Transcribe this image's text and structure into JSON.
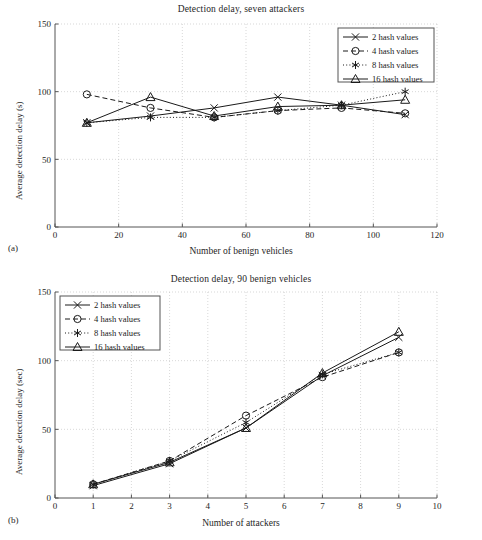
{
  "figure": {
    "panels": [
      {
        "panel_id": "(a)",
        "title": "Detection delay, seven attackers",
        "xlabel": "Number of benign vehicles",
        "ylabel": "Average detection delay (s)",
        "xticks": [
          "0",
          "20",
          "40",
          "60",
          "80",
          "100",
          "120"
        ],
        "yticks": [
          "0",
          "50",
          "100",
          "150"
        ],
        "legend": [
          {
            "label": "2 hash values",
            "marker": "x-cross",
            "dash": "solid"
          },
          {
            "label": "4 hash values",
            "marker": "circle",
            "dash": "dashed"
          },
          {
            "label": "8 hash values",
            "marker": "asterisk",
            "dash": "dotted"
          },
          {
            "label": "16 hash values",
            "marker": "triangle",
            "dash": "solid"
          }
        ]
      },
      {
        "panel_id": "(b)",
        "title": "Detection delay, 90 benign vehicles",
        "xlabel": "Number of attackers",
        "ylabel": "Average detection delay (sec)",
        "xticks": [
          "0",
          "1",
          "2",
          "3",
          "4",
          "5",
          "6",
          "7",
          "8",
          "9",
          "10"
        ],
        "yticks": [
          "0",
          "50",
          "100",
          "150"
        ],
        "legend": [
          {
            "label": "2 hash values",
            "marker": "x-cross",
            "dash": "solid"
          },
          {
            "label": "4 hash values",
            "marker": "circle",
            "dash": "dashed"
          },
          {
            "label": "8 hash values",
            "marker": "asterisk",
            "dash": "dotted"
          },
          {
            "label": "16 hash values",
            "marker": "triangle",
            "dash": "solid"
          }
        ]
      }
    ]
  },
  "chart_data": [
    {
      "type": "line",
      "panel": "(a)",
      "title": "Detection delay, seven attackers",
      "xlabel": "Number of benign vehicles",
      "ylabel": "Average detection delay (s)",
      "xlim": [
        0,
        120
      ],
      "ylim": [
        0,
        150
      ],
      "xticks": [
        0,
        20,
        40,
        60,
        80,
        100,
        120
      ],
      "yticks": [
        0,
        50,
        100,
        150
      ],
      "grid": true,
      "legend_position": "top-right",
      "x": [
        10,
        30,
        50,
        70,
        90,
        110
      ],
      "series": [
        {
          "name": "2 hash values",
          "marker": "x-cross",
          "dash": "solid",
          "values": [
            77,
            82,
            88,
            96,
            90,
            83
          ]
        },
        {
          "name": "4 hash values",
          "marker": "circle",
          "dash": "dashed",
          "values": [
            98,
            88,
            81,
            86,
            88,
            84
          ]
        },
        {
          "name": "8 hash values",
          "marker": "asterisk",
          "dash": "dotted",
          "values": [
            77,
            81,
            81,
            86,
            90,
            100
          ]
        },
        {
          "name": "16 hash values",
          "marker": "triangle",
          "dash": "solid",
          "values": [
            77,
            96,
            82,
            89,
            90,
            94
          ]
        }
      ]
    },
    {
      "type": "line",
      "panel": "(b)",
      "title": "Detection delay, 90 benign vehicles",
      "xlabel": "Number of attackers",
      "ylabel": "Average detection delay (sec)",
      "xlim": [
        0,
        10
      ],
      "ylim": [
        0,
        150
      ],
      "xticks": [
        0,
        1,
        2,
        3,
        4,
        5,
        6,
        7,
        8,
        9,
        10
      ],
      "yticks": [
        0,
        50,
        100,
        150
      ],
      "grid": true,
      "legend_position": "top-left",
      "x": [
        1,
        3,
        5,
        7,
        9
      ],
      "series": [
        {
          "name": "2 hash values",
          "marker": "x-cross",
          "dash": "solid",
          "values": [
            9,
            25,
            51,
            89,
            117
          ]
        },
        {
          "name": "4 hash values",
          "marker": "circle",
          "dash": "dashed",
          "values": [
            10,
            27,
            60,
            88,
            106
          ]
        },
        {
          "name": "8 hash values",
          "marker": "asterisk",
          "dash": "dotted",
          "values": [
            10,
            27,
            55,
            90,
            106
          ]
        },
        {
          "name": "16 hash values",
          "marker": "triangle",
          "dash": "solid",
          "values": [
            10,
            26,
            51,
            91,
            121
          ]
        }
      ]
    }
  ]
}
